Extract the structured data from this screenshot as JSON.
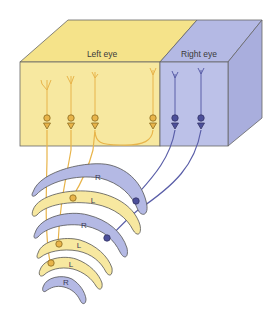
{
  "diagram": {
    "type": "ocular dominance columns and LGN lamination",
    "cortex_block": {
      "left_region_label": "Left eye",
      "right_region_label": "Right eye",
      "left_color": "#f7e79a",
      "left_top_color": "#f5e38a",
      "right_color": "#b8bde6",
      "right_side_color": "#a9aedd",
      "edge_color": "#555555"
    },
    "neurons": {
      "left_eye_color": "#e8b44a",
      "right_eye_color": "#4c4f9a",
      "left_eye_count": 4,
      "right_eye_count": 2
    },
    "lgn_layers": [
      {
        "label": "R",
        "eye": "right"
      },
      {
        "label": "L",
        "eye": "left"
      },
      {
        "label": "R",
        "eye": "right"
      },
      {
        "label": "L",
        "eye": "left"
      },
      {
        "label": "L",
        "eye": "left"
      },
      {
        "label": "R",
        "eye": "right"
      }
    ]
  }
}
